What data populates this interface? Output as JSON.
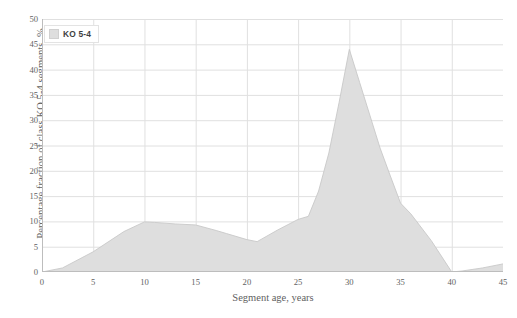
{
  "chart_data": {
    "type": "area",
    "title": "",
    "xlabel": "Segment age, years",
    "ylabel": "Percentage fraction of class KO 5-4 segments, %",
    "xlim": [
      0,
      45
    ],
    "ylim": [
      0,
      50
    ],
    "xticks": [
      0,
      5,
      10,
      15,
      20,
      25,
      30,
      35,
      40,
      45
    ],
    "yticks": [
      0,
      5,
      10,
      15,
      20,
      25,
      30,
      35,
      40,
      45,
      50
    ],
    "grid": true,
    "legend_position": "top-left",
    "series": [
      {
        "name": "KO 5-4",
        "color": "#dedede",
        "x": [
          0,
          2,
          5,
          8,
          10,
          11,
          13,
          15,
          17,
          18,
          20,
          21,
          23,
          25,
          26,
          27,
          28,
          29,
          30,
          31,
          32,
          33,
          34,
          35,
          36,
          38,
          40,
          41,
          43,
          45
        ],
        "values": [
          0,
          0.8,
          4.0,
          8.0,
          9.9,
          9.8,
          9.5,
          9.3,
          8.2,
          7.6,
          6.4,
          6.0,
          8.3,
          10.4,
          11.0,
          16.0,
          23.5,
          33.5,
          44.0,
          37.5,
          31.0,
          24.5,
          19.0,
          13.6,
          11.5,
          6.2,
          0.0,
          0.2,
          0.8,
          1.6
        ]
      }
    ]
  },
  "axes": {
    "y_title": "Percentage fraction of class KO 5-4 segments, %",
    "x_title": "Segment age, years",
    "y_tick_labels": [
      "50",
      "45",
      "40",
      "35",
      "30",
      "25",
      "20",
      "15",
      "10",
      "5",
      "0"
    ],
    "x_tick_labels": [
      "0",
      "5",
      "10",
      "15",
      "20",
      "25",
      "30",
      "35",
      "40",
      "45"
    ]
  },
  "legend": {
    "entries": [
      {
        "label": "KO 5-4",
        "swatch_color": "#dedede"
      }
    ]
  },
  "style": {
    "grid_color": "#e0e0e0",
    "axis_color": "#bdbdbd",
    "fill_color": "#dedede",
    "line_color": "#c8c8c8",
    "background": "#ffffff",
    "text_color": "#5f5f5f"
  }
}
